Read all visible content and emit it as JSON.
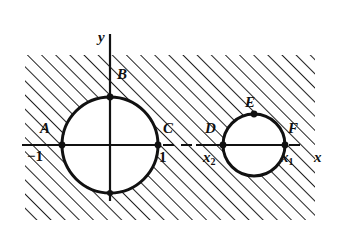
{
  "figure": {
    "canvas": {
      "width": 339,
      "height": 242
    },
    "colors": {
      "ink": "#111111",
      "hatch": "#222222",
      "background": "#ffffff"
    },
    "hatch_region": {
      "x": 25,
      "y": 55,
      "width": 290,
      "height": 165,
      "angle_deg": 45,
      "spacing_px": 10
    },
    "axes": {
      "x_axis": {
        "y": 145,
        "x_start": 22,
        "x_end": 332,
        "solid_until": 160,
        "dashed_after": true
      },
      "y_axis": {
        "x": 110,
        "y_start": 34,
        "y_end": 201
      },
      "x_label": "x",
      "y_label": "y"
    },
    "circles": [
      {
        "name": "large-circle",
        "cx": 110,
        "cy": 145,
        "r": 48
      },
      {
        "name": "small-circle",
        "cx": 254,
        "cy": 145,
        "r": 31
      }
    ],
    "points": [
      {
        "id": "A",
        "label": "A",
        "x": 62,
        "y": 145,
        "label_x": 40,
        "label_y": 121
      },
      {
        "id": "B",
        "label": "B",
        "x": 110,
        "y": 97,
        "label_x": 117,
        "label_y": 67
      },
      {
        "id": "C",
        "label": "C",
        "x": 158,
        "y": 145,
        "label_x": 163,
        "label_y": 121
      },
      {
        "id": "D",
        "label": "D",
        "x": 223,
        "y": 145,
        "label_x": 205,
        "label_y": 121
      },
      {
        "id": "E",
        "label": "E",
        "x": 254,
        "y": 114,
        "label_x": 245,
        "label_y": 95
      },
      {
        "id": "F",
        "label": "F",
        "x": 285,
        "y": 145,
        "label_x": 288,
        "label_y": 121
      }
    ],
    "tick_labels": [
      {
        "id": "neg-one",
        "text": "−1",
        "x": 27,
        "y": 149
      },
      {
        "id": "one",
        "text": "1",
        "x": 159,
        "y": 150
      },
      {
        "id": "x-two",
        "base": "x",
        "sub": "2",
        "x": 203,
        "y": 150
      },
      {
        "id": "x-one",
        "base": "x",
        "sub": "1",
        "x": 281,
        "y": 150
      }
    ],
    "axis_labels": [
      {
        "id": "y-axis-label",
        "text": "y",
        "x": 98,
        "y": 30
      },
      {
        "id": "x-axis-label",
        "text": "x",
        "x": 314,
        "y": 150
      }
    ]
  }
}
